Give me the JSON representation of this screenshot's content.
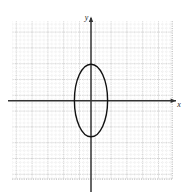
{
  "figure": {
    "title": "",
    "background_color": "#ffffff",
    "width": 185,
    "height": 196
  },
  "axes": {
    "x_label": "x",
    "y_label": "y",
    "origin_x": 91,
    "origin_y": 101,
    "axis_color": "#333333",
    "x_axis_start": 8,
    "x_axis_end": 179,
    "y_axis_start": 14,
    "y_axis_end": 192
  },
  "grid": {
    "left": 14,
    "top": 21,
    "right": 172,
    "bottom": 180,
    "major_spacing": 15.8,
    "minor_per_major": 4,
    "major_color": "#9a9a9a",
    "minor_color": "#c4c4c4",
    "grid_on": true
  },
  "chart_data": {
    "type": "line",
    "title": "",
    "xlabel": "x",
    "ylabel": "y",
    "grid": true,
    "legend": false,
    "xlim": [
      -4.875,
      5.125
    ],
    "ylim": [
      -5,
      5.0625
    ],
    "unit_px": 15.8,
    "curves": [
      {
        "name": "ellipse",
        "shape": "ellipse",
        "center": [
          0,
          0
        ],
        "semi_axis_x": 1.05,
        "semi_axis_y": 2.3,
        "stroke": "#111111",
        "stroke_width": 1.4,
        "fill": "none",
        "center_px": [
          91,
          100.5
        ],
        "radius_px": [
          16.6,
          36.3
        ]
      }
    ]
  }
}
